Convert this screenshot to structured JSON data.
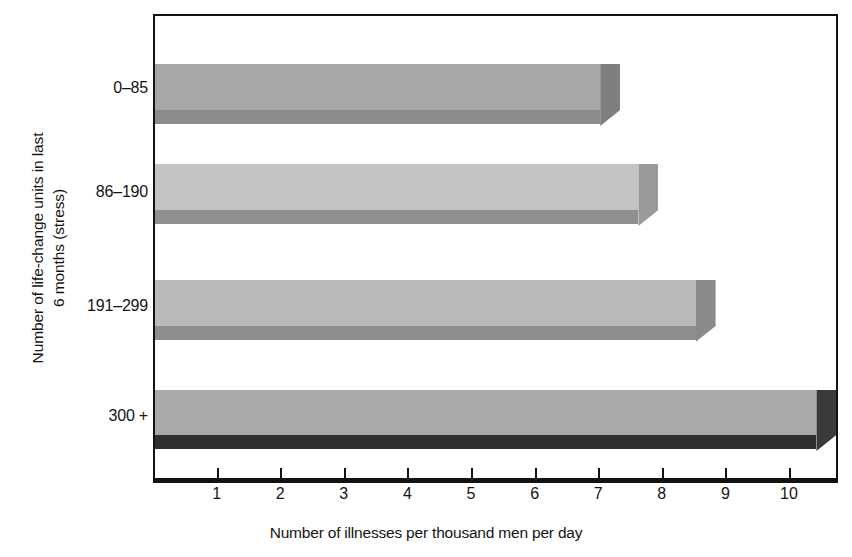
{
  "chart_data": {
    "type": "bar",
    "orientation": "horizontal",
    "style": "3d-block",
    "title": "",
    "xlabel": "Number of illnesses per thousand men per day",
    "ylabel": "Number of life-change units in last\n6 months (stress)",
    "categories": [
      "0–85",
      "86–190",
      "191–299",
      "300 +"
    ],
    "values": [
      7.0,
      7.6,
      8.5,
      10.4
    ],
    "xlim": [
      0,
      10.8
    ],
    "xticks": [
      1,
      2,
      3,
      4,
      5,
      6,
      7,
      8,
      9,
      10
    ],
    "xticklabels": [
      "1",
      "2",
      "3",
      "4",
      "5",
      "6",
      "7",
      "8",
      "9",
      "10"
    ],
    "grid": false,
    "legend": null,
    "series": [
      {
        "name": "Number of illnesses per thousand men per day",
        "values": [
          7.0,
          7.6,
          8.5,
          10.4
        ]
      }
    ],
    "bar_styles": [
      {
        "front": "#a7a7a7",
        "base": "#8b8b8b",
        "side": "#7f7f7f"
      },
      {
        "front": "#c3c3c3",
        "base": "#8f8f8f",
        "side": "#9a9a9a"
      },
      {
        "front": "#b9b9b9",
        "base": "#8d8d8d",
        "side": "#8a8a8a"
      },
      {
        "front": "#a9a9a9",
        "base": "#2f2f2f",
        "side": "#3a3a3a"
      }
    ]
  },
  "axes": {
    "x_title": "Number of illnesses per thousand men per day",
    "y_title": "Number of life-change units in last\n6 months (stress)",
    "x_tick_labels": [
      "1",
      "2",
      "3",
      "4",
      "5",
      "6",
      "7",
      "8",
      "9",
      "10"
    ],
    "y_tick_labels": [
      "0–85",
      "86–190",
      "191–299",
      "300 +"
    ]
  },
  "colors": {
    "frame": "#121212",
    "text": "#141414",
    "background": "#ffffff"
  }
}
